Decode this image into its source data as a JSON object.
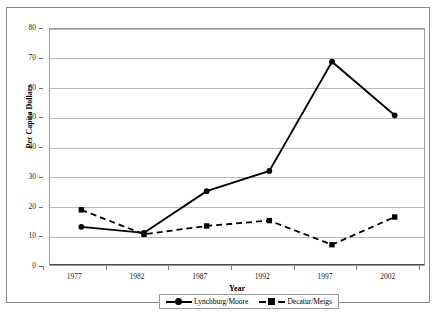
{
  "chart_data": {
    "type": "line",
    "title": "",
    "xlabel": "Year",
    "ylabel": "Per Capita Dollars",
    "categories": [
      "1977",
      "1982",
      "1987",
      "1992",
      "1997",
      "2002"
    ],
    "xlim": [
      1977,
      2002
    ],
    "ylim": [
      0,
      80
    ],
    "yticks": [
      0,
      10,
      20,
      30,
      40,
      50,
      60,
      70,
      80
    ],
    "ytick_labels": [
      "0",
      "10",
      "20",
      "30",
      "40",
      "50",
      "60",
      "70",
      "80"
    ],
    "grid": true,
    "legend_position": "bottom",
    "series": [
      {
        "name": "Lynchburg/Moore",
        "marker": "circle",
        "linestyle": "solid",
        "color": "#000000",
        "values": [
          13.5,
          11.5,
          25.5,
          32.3,
          69.0,
          51.0
        ]
      },
      {
        "name": "Decatur/Meigs",
        "marker": "square",
        "linestyle": "dashed",
        "color": "#000000",
        "values": [
          19.2,
          11.0,
          13.8,
          15.6,
          7.5,
          16.8
        ]
      }
    ]
  },
  "legend": {
    "entries": [
      {
        "label": "Lynchburg/Moore"
      },
      {
        "label": "Decatur/Meigs"
      }
    ]
  }
}
